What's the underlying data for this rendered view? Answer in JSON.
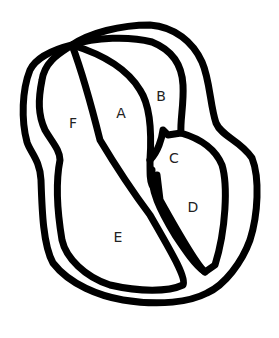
{
  "diagram": {
    "type": "heart-like cross-section outline with labeled chambers",
    "stroke_color": "#000000",
    "background": "#ffffff",
    "labels": [
      {
        "id": "A",
        "text": "A",
        "x": 121,
        "y": 113
      },
      {
        "id": "B",
        "text": "B",
        "x": 161,
        "y": 96
      },
      {
        "id": "C",
        "text": "C",
        "x": 174,
        "y": 158
      },
      {
        "id": "D",
        "text": "D",
        "x": 193,
        "y": 207
      },
      {
        "id": "E",
        "text": "E",
        "x": 118,
        "y": 237
      },
      {
        "id": "F",
        "text": "F",
        "x": 73,
        "y": 123
      }
    ]
  }
}
